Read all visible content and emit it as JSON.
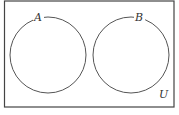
{
  "diagram": {
    "type": "venn",
    "universe_label": "U",
    "sets": [
      {
        "label": "A"
      },
      {
        "label": "B"
      }
    ],
    "colors": {
      "stroke": "#444444",
      "background": "#ffffff"
    }
  }
}
